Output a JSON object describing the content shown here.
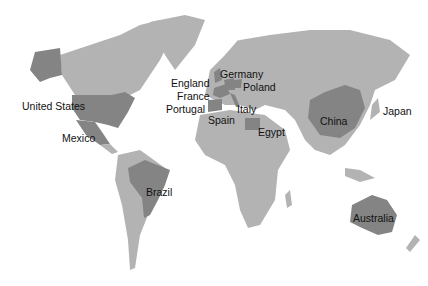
{
  "map": {
    "colors": {
      "land": "#b3b3b3",
      "highlight": "#848484",
      "background": "#ffffff"
    },
    "labels": [
      {
        "id": "united-states",
        "text": "United States",
        "x": 22,
        "y": 106
      },
      {
        "id": "mexico",
        "text": "Mexico",
        "x": 62,
        "y": 138
      },
      {
        "id": "england",
        "text": "England",
        "x": 171,
        "y": 80
      },
      {
        "id": "france",
        "text": "France",
        "x": 177,
        "y": 94
      },
      {
        "id": "portugal",
        "text": "Portugal",
        "x": 166,
        "y": 107
      },
      {
        "id": "spain",
        "text": "Spain",
        "x": 208,
        "y": 118
      },
      {
        "id": "germany",
        "text": "Germany",
        "x": 221,
        "y": 70
      },
      {
        "id": "poland",
        "text": "Poland",
        "x": 243,
        "y": 83
      },
      {
        "id": "italy",
        "text": "Italy",
        "x": 237,
        "y": 102
      },
      {
        "id": "egypt",
        "text": "Egypt",
        "x": 258,
        "y": 127
      },
      {
        "id": "china",
        "text": "China",
        "x": 320,
        "y": 118
      },
      {
        "id": "japan",
        "text": "Japan",
        "x": 383,
        "y": 106
      },
      {
        "id": "brazil",
        "text": "Brazil",
        "x": 146,
        "y": 189
      },
      {
        "id": "australia",
        "text": "Australia",
        "x": 353,
        "y": 214
      }
    ]
  }
}
